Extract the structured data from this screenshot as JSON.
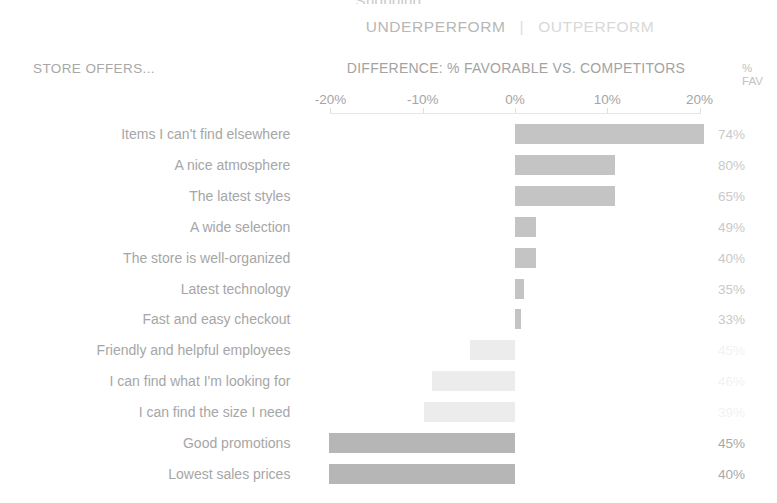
{
  "header": {
    "cut_title": "Shopping",
    "underperform_label": "UNDERPERFORM",
    "separator": "|",
    "outperform_label": "OUTPERFORM",
    "row_header": "STORE OFFERS...",
    "axis_title": "DIFFERENCE: % FAVORABLE VS. COMPETITORS",
    "fav_col_line1": "%",
    "fav_col_line2": "FAV"
  },
  "colors": {
    "bar_positive": "#c4c4c4",
    "bar_negative_light": "#ececec",
    "bar_negative_dark": "#b6b6b6",
    "text": "#a6a6a6",
    "axis": "#e0e0e0"
  },
  "chart_data": {
    "type": "bar",
    "orientation": "horizontal",
    "title": "DIFFERENCE: % FAVORABLE VS. COMPETITORS",
    "xlabel": "DIFFERENCE: % FAVORABLE VS. COMPETITORS",
    "ylabel": "STORE OFFERS...",
    "xlim": [
      -20,
      20
    ],
    "xticks": [
      -20,
      -10,
      0,
      10,
      20
    ],
    "xtick_labels": [
      "-20%",
      "-10%",
      "0%",
      "10%",
      "20%"
    ],
    "grid": false,
    "legend": [
      "UNDERPERFORM",
      "OUTPERFORM"
    ],
    "categories": [
      "Items I can't find elsewhere",
      "A nice atmosphere",
      "The latest styles",
      "A wide selection",
      "The store is well-organized",
      "Latest technology",
      "Fast and easy checkout",
      "Friendly and helpful employees",
      "I can find what I'm looking for",
      "I can find the size I need",
      "Good promotions",
      "Lowest sales prices"
    ],
    "values": [
      20.5,
      10.8,
      10.8,
      2.3,
      2.3,
      1.0,
      0.7,
      -4.9,
      -9.0,
      -9.9,
      -20.1,
      -20.1
    ],
    "series": [
      {
        "name": "Difference vs. competitors",
        "values": [
          20.5,
          10.8,
          10.8,
          2.3,
          2.3,
          1.0,
          0.7,
          -4.9,
          -9.0,
          -9.9,
          -20.1,
          -20.1
        ]
      },
      {
        "name": "% FAV",
        "values": [
          74,
          80,
          65,
          49,
          40,
          35,
          33,
          45,
          46,
          39,
          45,
          40
        ]
      }
    ],
    "fav_labels": [
      "74%",
      "80%",
      "65%",
      "49%",
      "40%",
      "35%",
      "33%",
      "45%",
      "46%",
      "39%",
      "45%",
      "40%"
    ]
  }
}
